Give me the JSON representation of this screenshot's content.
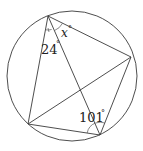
{
  "diagram": {
    "type": "cyclic-quadrilateral-with-diagonals",
    "circle": {
      "cx": 72,
      "cy": 76,
      "r": 65
    },
    "vertices": {
      "top": {
        "x": 48,
        "y": 16
      },
      "right": {
        "x": 131,
        "y": 57
      },
      "bottom_right": {
        "x": 100,
        "y": 135
      },
      "bottom_left": {
        "x": 28,
        "y": 124
      }
    },
    "angles": [
      {
        "id": "angle-x",
        "value": "x",
        "unit": "°",
        "at": "top",
        "between": [
          "right",
          "bottom_right"
        ]
      },
      {
        "id": "angle-24",
        "value": "24",
        "unit": "°",
        "at": "top",
        "between": [
          "bottom_right",
          "bottom_left"
        ]
      },
      {
        "id": "angle-101",
        "value": "101",
        "unit": "°",
        "at": "bottom_right",
        "between": [
          "bottom_left",
          "right"
        ]
      }
    ],
    "labels": {
      "x": "x",
      "deg1": "°",
      "n24": "24",
      "deg2": "°",
      "n101": "101",
      "deg3": "°"
    }
  }
}
